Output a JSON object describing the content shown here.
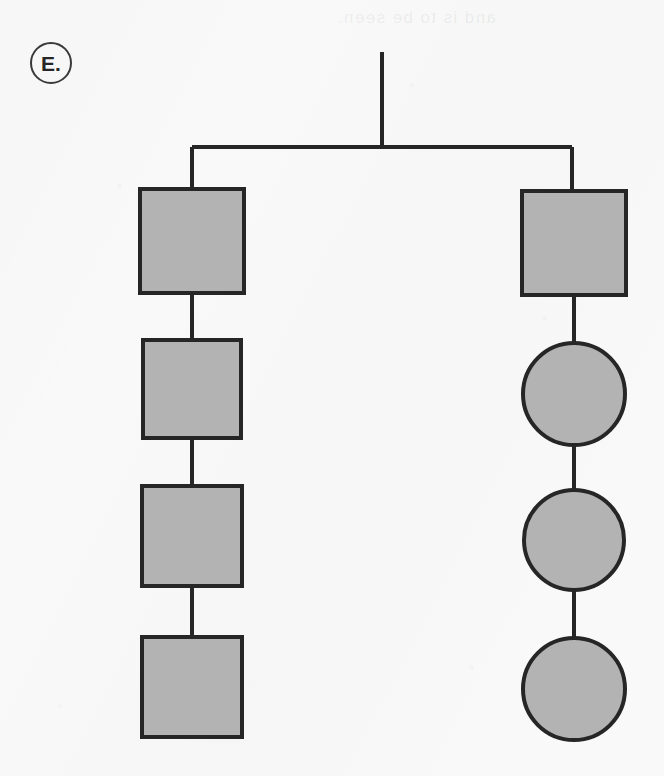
{
  "figure": {
    "panel_label": "E.",
    "background_color": "#f9f9f9",
    "bleedthrough_text": "and is to be seen.",
    "width": 664,
    "height": 776
  },
  "style": {
    "shape_fill": "#b3b3b3",
    "shape_stroke": "#262626",
    "shape_stroke_width": 4,
    "line_color": "#262626",
    "line_width": 4,
    "badge_stroke": "#3a3a3a"
  },
  "chart_data": {
    "type": "diagram",
    "diagram_kind": "pedigree-tree",
    "title": "E.",
    "root": {
      "name": "root-stem",
      "stem_x": 382,
      "stem_top_y": 52,
      "stem_bottom_y": 147
    },
    "crossbar": {
      "y": 147,
      "x_start": 192,
      "x_end": 572
    },
    "branches": [
      {
        "name": "left-branch",
        "x": 192,
        "nodes": [
          {
            "id": "L1",
            "shape": "square",
            "cx": 192,
            "cy": 241,
            "size": 104,
            "fill": "#b3b3b3",
            "filled": true
          },
          {
            "id": "L2",
            "shape": "square",
            "cx": 192,
            "cy": 389,
            "size": 98,
            "fill": "#b3b3b3",
            "filled": true
          },
          {
            "id": "L3",
            "shape": "square",
            "cx": 192,
            "cy": 536,
            "size": 100,
            "fill": "#b3b3b3",
            "filled": true
          },
          {
            "id": "L4",
            "shape": "square",
            "cx": 192,
            "cy": 687,
            "size": 100,
            "fill": "#b3b3b3",
            "filled": true
          }
        ],
        "connectors": [
          {
            "from": "L1",
            "to": "L2"
          },
          {
            "from": "L2",
            "to": "L3"
          },
          {
            "from": "L3",
            "to": "L4"
          }
        ]
      },
      {
        "name": "right-branch",
        "x": 572,
        "nodes": [
          {
            "id": "R1",
            "shape": "square",
            "cx": 574,
            "cy": 243,
            "size": 104,
            "fill": "#b3b3b3",
            "filled": true
          },
          {
            "id": "R2",
            "shape": "circle",
            "cx": 574,
            "cy": 394,
            "size": 102,
            "fill": "#b3b3b3",
            "filled": true
          },
          {
            "id": "R3",
            "shape": "circle",
            "cx": 574,
            "cy": 540,
            "size": 100,
            "fill": "#b3b3b3",
            "filled": true
          },
          {
            "id": "R4",
            "shape": "circle",
            "cx": 574,
            "cy": 689,
            "size": 102,
            "fill": "#b3b3b3",
            "filled": true
          }
        ],
        "connectors": [
          {
            "from": "R1",
            "to": "R2"
          },
          {
            "from": "R2",
            "to": "R3"
          },
          {
            "from": "R3",
            "to": "R4"
          }
        ]
      }
    ],
    "legend": [],
    "annotations": []
  }
}
